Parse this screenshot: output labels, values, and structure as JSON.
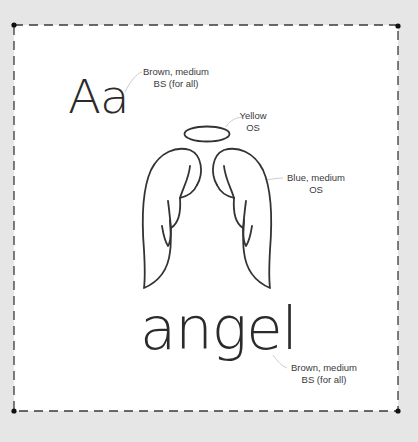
{
  "sample": {
    "letters": "Aa",
    "word": "angel"
  },
  "notes": {
    "letters": {
      "line1": "Brown, medium",
      "line2": "BS (for all)"
    },
    "halo": {
      "line1": "Yellow",
      "line2": "OS"
    },
    "wings": {
      "line1": "Blue, medium",
      "line2": "OS"
    },
    "word": {
      "line1": "Brown, medium",
      "line2": "BS (for all)"
    }
  },
  "colors": {
    "background": "#e6e6e6",
    "card": "#ffffff",
    "ink": "#2b2b2b",
    "note_text": "#3a3a3a",
    "leader": "#c8c8c8"
  },
  "icons": {
    "illustration": "angel-wings-with-halo"
  }
}
